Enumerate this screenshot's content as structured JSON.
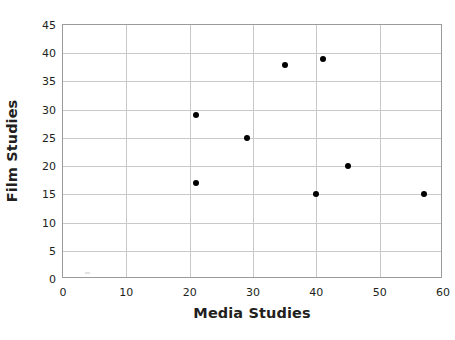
{
  "chart_data": {
    "type": "scatter",
    "title": "",
    "xlabel": "Media Studies",
    "ylabel": "Film Studies",
    "xlim": [
      0,
      60
    ],
    "ylim": [
      0,
      45
    ],
    "xticks": [
      0,
      10,
      20,
      30,
      40,
      50,
      60
    ],
    "yticks": [
      0,
      5,
      10,
      15,
      20,
      25,
      30,
      35,
      40,
      45
    ],
    "xtick_labels": [
      "0",
      "10",
      "20",
      "30",
      "40",
      "50",
      "60"
    ],
    "ytick_labels": [
      "0",
      "5",
      "10",
      "15",
      "20",
      "25",
      "30",
      "35",
      "40",
      "45"
    ],
    "grid": true,
    "legend": false,
    "marker": "filled-circle",
    "marker_color": "#000000",
    "grid_color": "#c9c9c9",
    "frame_color": "#9b9b9b",
    "background": "#ffffff",
    "x": [
      21,
      21,
      29,
      35,
      40,
      41,
      45,
      57
    ],
    "y": [
      29,
      17,
      25,
      38,
      15,
      39,
      20,
      15
    ],
    "points": [
      {
        "x": 21,
        "y": 29
      },
      {
        "x": 21,
        "y": 17
      },
      {
        "x": 29,
        "y": 25
      },
      {
        "x": 35,
        "y": 38
      },
      {
        "x": 40,
        "y": 15
      },
      {
        "x": 41,
        "y": 39
      },
      {
        "x": 45,
        "y": 20
      },
      {
        "x": 57,
        "y": 15
      }
    ]
  }
}
